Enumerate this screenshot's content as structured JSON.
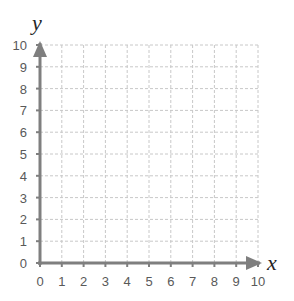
{
  "chart_data": {
    "type": "scatter",
    "title": "",
    "xlabel": "x",
    "ylabel": "y",
    "xlim": [
      0,
      10
    ],
    "ylim": [
      0,
      10
    ],
    "x_ticks": [
      "0",
      "1",
      "2",
      "3",
      "4",
      "5",
      "6",
      "7",
      "8",
      "9",
      "10"
    ],
    "y_ticks": [
      "0",
      "1",
      "2",
      "3",
      "4",
      "5",
      "6",
      "7",
      "8",
      "9",
      "10"
    ],
    "grid": true,
    "grid_style": "dashed",
    "series": [],
    "legend": null
  },
  "colors": {
    "axis": "#7f7f7f",
    "grid": "#c8c8c8",
    "tick_label": "#595959",
    "axis_name": "#262626"
  }
}
